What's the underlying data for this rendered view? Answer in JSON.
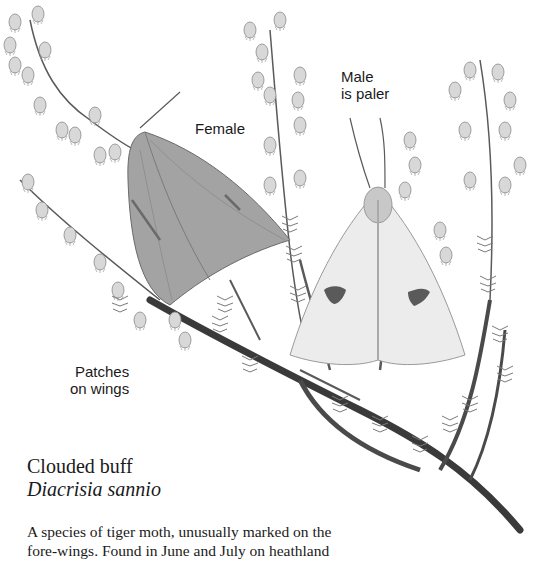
{
  "illustration": {
    "subject": "moths-on-heather",
    "style": "grayscale pencil drawing",
    "colors": {
      "background": "#ffffff",
      "stem": "#4a4a4a",
      "flower": "#d8d8d8",
      "female_wing": "#9a9a9a",
      "male_wing": "#e4e4e4",
      "wing_patch": "#5a5a5a"
    }
  },
  "labels": {
    "female": "Female",
    "male_line1": "Male",
    "male_line2": "is paler",
    "patches_line1": "Patches",
    "patches_line2": "on wings"
  },
  "caption": {
    "common_name": "Clouded buff",
    "latin_name": "Diacrisia sannio",
    "description_lines": [
      "A species of tiger moth, unusually marked on the",
      "fore-wings. Found in June and July on heathland"
    ]
  }
}
